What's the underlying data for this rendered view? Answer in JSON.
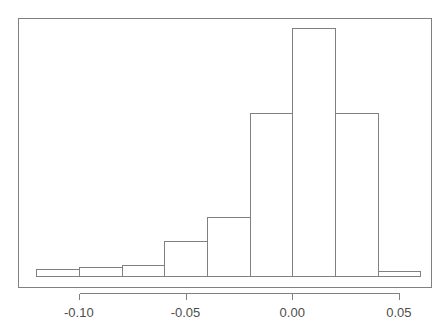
{
  "figure": {
    "width": 447,
    "height": 329,
    "background": "#ffffff",
    "stroke_color": "#808080",
    "text_color": "#4d4d4d",
    "title": "",
    "plot_area": {
      "left": 18,
      "top": 18,
      "right": 432,
      "bottom": 288,
      "baseline": 276
    }
  },
  "chart_data": {
    "type": "bar",
    "subtype": "histogram",
    "title": "",
    "subtitle": "",
    "xlabel": "",
    "ylabel": "",
    "xlim": [
      -0.1285,
      0.0655
    ],
    "ylim": [
      0,
      258
    ],
    "grid": false,
    "legend": false,
    "legend_position": "none",
    "bin_width": 0.02,
    "bin_edges": [
      -0.12,
      -0.1,
      -0.08,
      -0.06,
      -0.04,
      -0.02,
      0.0,
      0.02,
      0.04,
      0.06
    ],
    "bin_centers": [
      -0.11,
      -0.09,
      -0.07,
      -0.05,
      -0.03,
      -0.01,
      0.01,
      0.03,
      0.05
    ],
    "categories": [
      "-0.12..-0.10",
      "-0.10..-0.08",
      "-0.08..-0.06",
      "-0.06..-0.04",
      "-0.04..-0.02",
      "-0.02..0.00",
      "0.00..0.02",
      "0.02..0.04",
      "0.04..0.06"
    ],
    "values": [
      7,
      9,
      11,
      35,
      59,
      163,
      248,
      163,
      5
    ],
    "bars": [
      {
        "x0": -0.12,
        "x1": -0.1,
        "count": 7
      },
      {
        "x0": -0.1,
        "x1": -0.08,
        "count": 9
      },
      {
        "x0": -0.08,
        "x1": -0.06,
        "count": 11
      },
      {
        "x0": -0.06,
        "x1": -0.04,
        "count": 35
      },
      {
        "x0": -0.04,
        "x1": -0.02,
        "count": 59
      },
      {
        "x0": -0.02,
        "x1": 0.0,
        "count": 163
      },
      {
        "x0": 0.0,
        "x1": 0.02,
        "count": 248
      },
      {
        "x0": 0.02,
        "x1": 0.04,
        "count": 163
      },
      {
        "x0": 0.04,
        "x1": 0.06,
        "count": 5
      }
    ],
    "xticks": [
      -0.1,
      -0.05,
      0.0,
      0.05
    ],
    "xticklabels": [
      "-0.10",
      "-0.05",
      "0.00",
      "0.05"
    ],
    "yticks": [],
    "yticklabels": [],
    "annotations": []
  }
}
